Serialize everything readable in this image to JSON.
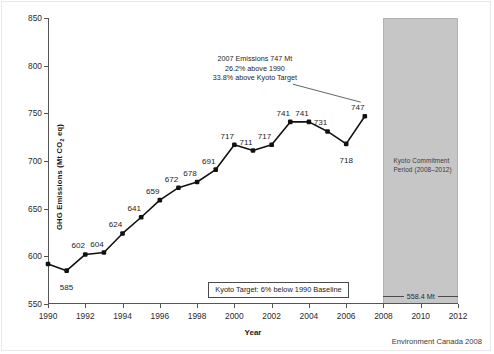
{
  "chart_data": {
    "type": "line",
    "title": "",
    "xlabel": "Year",
    "ylabel": "GHG Emissions (Mt CO2 eq)",
    "ylabel_html": "GHG Emissions (Mt CO<sub>2</sub> eq)",
    "xlim": [
      1990,
      2012
    ],
    "ylim": [
      550,
      850
    ],
    "yticks": [
      550,
      600,
      650,
      700,
      750,
      800,
      850
    ],
    "ytick_labels": [
      "550",
      "600",
      "650",
      "700",
      "750",
      "800",
      "850"
    ],
    "xticks": [
      1990,
      1992,
      1994,
      1996,
      1998,
      2000,
      2002,
      2004,
      2006,
      2008,
      2010,
      2012
    ],
    "xtick_labels": [
      "1990",
      "1992",
      "1994",
      "1996",
      "1998",
      "2000",
      "2002",
      "2004",
      "2006",
      "2008",
      "2010",
      "2012"
    ],
    "grid": false,
    "legend_position": "none",
    "series": [
      {
        "name": "GHG Emissions",
        "x": [
          1990,
          1991,
          1992,
          1993,
          1994,
          1995,
          1996,
          1997,
          1998,
          1999,
          2000,
          2001,
          2002,
          2003,
          2004,
          2005,
          2006,
          2007
        ],
        "values": [
          592,
          585,
          602,
          604,
          624,
          641,
          659,
          672,
          678,
          691,
          717,
          711,
          717,
          741,
          741,
          731,
          718,
          747
        ],
        "point_labels": [
          "",
          "585",
          "602",
          "604",
          "624",
          "641",
          "659",
          "672",
          "678",
          "691",
          "717",
          "711",
          "717",
          "741",
          "741",
          "731",
          "718",
          "747"
        ],
        "label_positions": [
          "below",
          "below",
          "above",
          "above",
          "above",
          "above",
          "above",
          "above",
          "above",
          "above",
          "above",
          "above",
          "above",
          "above",
          "above",
          "above",
          "below",
          "above"
        ],
        "marker": "square-dot",
        "color": "#111111"
      }
    ],
    "reference_lines": [
      {
        "name": "kyoto-target-line",
        "value": 558.4,
        "label": "558.4 Mt",
        "x_start": 2008,
        "x_end": 2012
      }
    ],
    "shaded_regions": [
      {
        "name": "kyoto-commitment-period",
        "x_start": 2008,
        "x_end": 2012,
        "color": "#c6c6c6",
        "label_line_1": "Kyoto Commitment",
        "label_line_2": "Period (2008–2012)"
      }
    ],
    "annotations": [
      {
        "name": "emissions-2007-callout",
        "line_1": "2007 Emissions 747 Mt",
        "line_2": "26.2% above 1990",
        "line_3": "33.8% above Kyoto Target",
        "points_to_x": 2007,
        "points_to_y": 747
      },
      {
        "name": "kyoto-target-callout",
        "text": "Kyoto Target: 6% below 1990 Baseline"
      }
    ]
  },
  "credit": {
    "text": "Environment Canada 2008"
  }
}
